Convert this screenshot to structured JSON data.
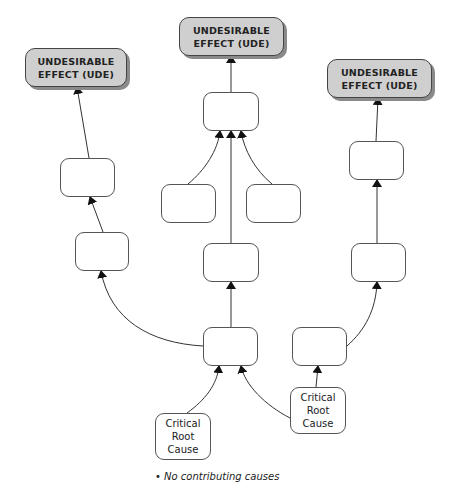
{
  "diagram": {
    "nodes": {
      "ude_left": {
        "line1": "UNDESIRABLE",
        "line2": "EFFECT (UDE)"
      },
      "ude_center": {
        "line1": "UNDESIRABLE",
        "line2": "EFFECT (UDE)"
      },
      "ude_right": {
        "line1": "UNDESIRABLE",
        "line2": "EFFECT (UDE)"
      },
      "crc_left": {
        "line1": "Critical",
        "line2": "Root",
        "line3": "Cause"
      },
      "crc_right": {
        "line1": "Critical",
        "line2": "Root",
        "line3": "Cause"
      }
    },
    "note": "• No contributing causes",
    "colors": {
      "ude_fill": "#cfcfcf",
      "ude_shadow": "#8a8a8a",
      "box_border": "#555555",
      "arrow": "#222222"
    }
  }
}
